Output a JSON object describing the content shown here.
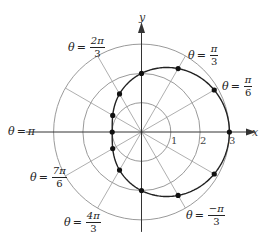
{
  "chart_data": {
    "type": "polar-curve",
    "title": "",
    "equation": "r = 2 + cos θ",
    "center_px": [
      141.5,
      132
    ],
    "px_per_unit": 29.3,
    "grid_circles": [
      1,
      2,
      3
    ],
    "radial_lines_every_deg": 30,
    "axes": {
      "x_label": "x",
      "y_label": "y"
    },
    "ticks": [
      {
        "label": "1",
        "r": 1
      },
      {
        "label": "2",
        "r": 2
      },
      {
        "label": "3",
        "r": 3
      }
    ],
    "points": [
      {
        "theta": "0",
        "r": 3
      },
      {
        "theta": "π/6",
        "r": 2.866
      },
      {
        "theta": "π/3",
        "r": 2.5
      },
      {
        "theta": "π/2",
        "r": 2
      },
      {
        "theta": "2π/3",
        "r": 1.5
      },
      {
        "theta": "5π/6",
        "r": 1.134
      },
      {
        "theta": "π",
        "r": 1
      },
      {
        "theta": "7π/6",
        "r": 1.134
      },
      {
        "theta": "4π/3",
        "r": 1.5
      },
      {
        "theta": "3π/2",
        "r": 2
      },
      {
        "theta": "5π/3",
        "r": 2.5
      },
      {
        "theta": "11π/6",
        "r": 2.866
      }
    ],
    "angle_labels": [
      {
        "prefix": "θ",
        "eq": "=",
        "num": "2π",
        "den": "3",
        "x": 68,
        "y": 36
      },
      {
        "prefix": "θ",
        "eq": "=",
        "num": "π",
        "den": "3",
        "x": 188,
        "y": 44
      },
      {
        "prefix": "θ",
        "eq": "=",
        "num": "π",
        "den": "6",
        "x": 222,
        "y": 74
      },
      {
        "prefix": "θ",
        "eq": "=",
        "simple": "π",
        "x": 10,
        "y": 126
      },
      {
        "prefix": "θ",
        "eq": "=",
        "num": "7π",
        "den": "6",
        "x": 30,
        "y": 166
      },
      {
        "prefix": "θ",
        "eq": "=",
        "num": "4π",
        "den": "3",
        "x": 64,
        "y": 210
      },
      {
        "prefix": "θ",
        "eq": "=",
        "num": "−π",
        "den": "3",
        "x": 186,
        "y": 205
      }
    ]
  },
  "labels": {
    "x_axis": "x",
    "y_axis": "y",
    "tick_1": "1",
    "tick_2": "2",
    "tick_3": "3",
    "theta_2pi3": {
      "prefix": "θ",
      "eq": "=",
      "num": "2π",
      "den": "3"
    },
    "theta_pi3": {
      "prefix": "θ",
      "eq": "=",
      "num": "π",
      "den": "3"
    },
    "theta_pi6": {
      "prefix": "θ",
      "eq": "=",
      "num": "π",
      "den": "6"
    },
    "theta_pi": {
      "prefix": "θ",
      "eq": "=",
      "val": "π"
    },
    "theta_7pi6": {
      "prefix": "θ",
      "eq": "=",
      "num": "7π",
      "den": "6"
    },
    "theta_4pi3": {
      "prefix": "θ",
      "eq": "=",
      "num": "4π",
      "den": "3"
    },
    "theta_mpi3": {
      "prefix": "θ",
      "eq": "=",
      "num": "−π",
      "den": "3"
    }
  },
  "colors": {
    "grid": "#9a9a9a",
    "axis": "#333333",
    "curve": "#222222",
    "point": "#111111",
    "text": "#222222"
  }
}
